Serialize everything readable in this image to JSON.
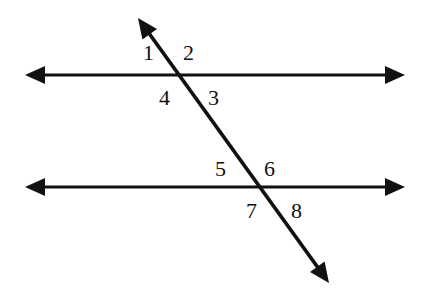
{
  "diagram": {
    "type": "parallel-lines-cut-by-transversal",
    "colors": {
      "stroke": "#111111",
      "background": "#ffffff"
    },
    "lines": {
      "top": {
        "y": 75,
        "x1": 25,
        "x2": 405
      },
      "bottom": {
        "y": 187,
        "x1": 25,
        "x2": 405
      },
      "transversal": {
        "x1": 138,
        "y1": 18,
        "x2": 329,
        "y2": 283
      }
    },
    "angle_labels": [
      {
        "id": "1",
        "text": "1",
        "x": 143,
        "y": 60
      },
      {
        "id": "2",
        "text": "2",
        "x": 183,
        "y": 60
      },
      {
        "id": "4",
        "text": "4",
        "x": 159,
        "y": 105
      },
      {
        "id": "3",
        "text": "3",
        "x": 208,
        "y": 105
      },
      {
        "id": "5",
        "text": "5",
        "x": 215,
        "y": 176
      },
      {
        "id": "6",
        "text": "6",
        "x": 264,
        "y": 176
      },
      {
        "id": "7",
        "text": "7",
        "x": 246,
        "y": 218
      },
      {
        "id": "8",
        "text": "8",
        "x": 291,
        "y": 218
      }
    ]
  }
}
